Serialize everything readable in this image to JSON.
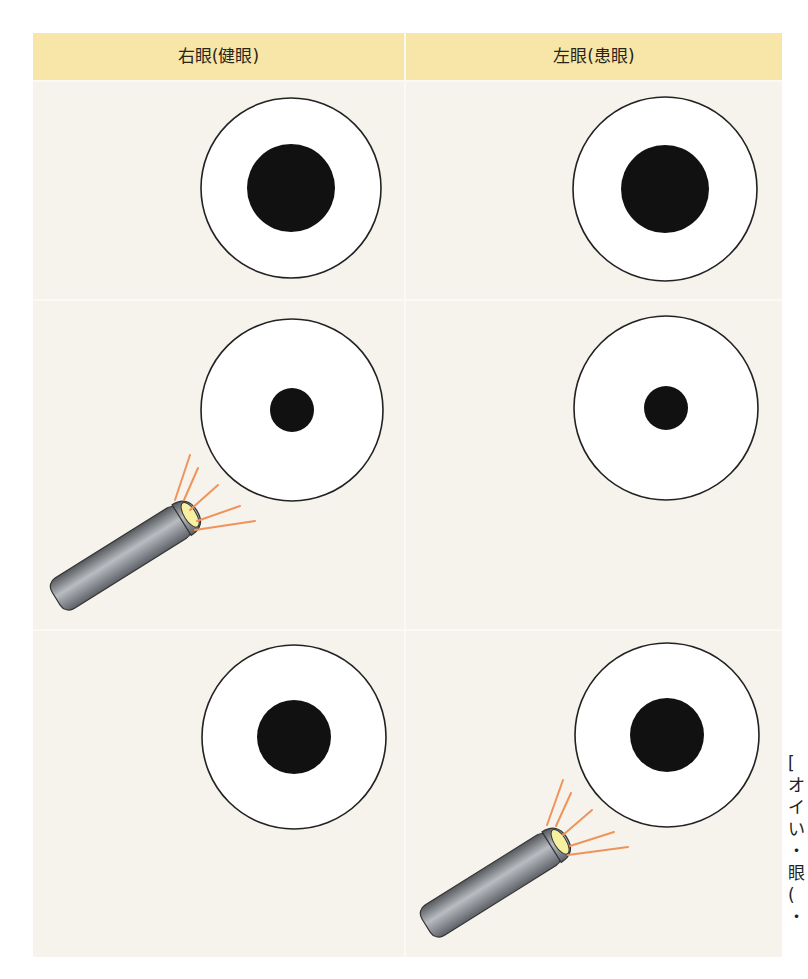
{
  "header": {
    "left_label": "右眼(健眼)",
    "right_label": "左眼(患眼)"
  },
  "colors": {
    "header_bg": "#f7e6a8",
    "cell_bg": "#f6f3ec",
    "pupil": "#111111",
    "iris_ring": "#ffffff",
    "light_rays": "#f0935a",
    "penlight_body": "#7c8086",
    "penlight_lens": "#f6f0a0"
  },
  "rows": [
    {
      "name": "baseline",
      "right_eye": {
        "pupil": "large",
        "pupil_radius": 44,
        "penlight": false
      },
      "left_eye": {
        "pupil": "large",
        "pupil_radius": 44,
        "penlight": false
      }
    },
    {
      "name": "light-on-right-eye",
      "right_eye": {
        "pupil": "small",
        "pupil_radius": 22,
        "penlight": true
      },
      "left_eye": {
        "pupil": "small",
        "pupil_radius": 22,
        "penlight": false
      }
    },
    {
      "name": "light-on-left-eye",
      "right_eye": {
        "pupil": "medium",
        "pupil_radius": 37,
        "penlight": false
      },
      "left_eye": {
        "pupil": "medium",
        "pupil_radius": 37,
        "penlight": true
      }
    }
  ],
  "caption_fragment": "[\nオ\nイ\nい\n・\n眼\n(\n・"
}
